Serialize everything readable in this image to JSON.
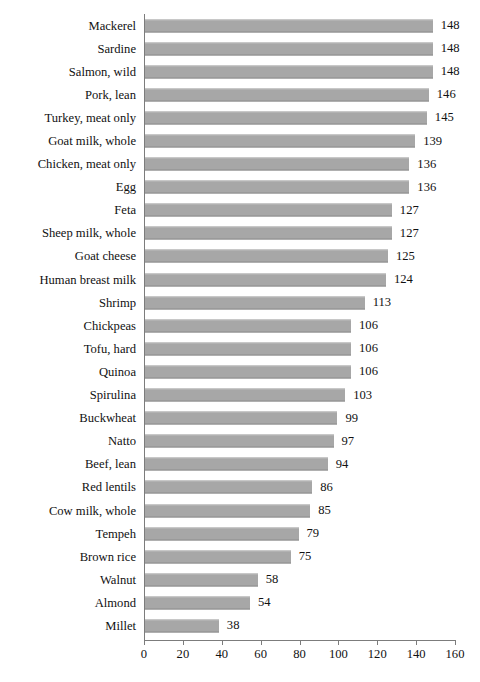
{
  "chart_data": {
    "type": "bar",
    "orientation": "horizontal",
    "title": "",
    "xlabel": "",
    "ylabel": "",
    "xlim": [
      0,
      160
    ],
    "xticks": [
      0,
      20,
      40,
      60,
      80,
      100,
      120,
      140,
      160
    ],
    "grid": false,
    "legend": null,
    "bar_color": "#a7a7a7",
    "axis_color": "#7c7c7c",
    "value_labels_shown": true,
    "categories": [
      "Mackerel",
      "Sardine",
      "Salmon, wild",
      "Pork, lean",
      "Turkey, meat only",
      "Goat milk, whole",
      "Chicken, meat only",
      "Egg",
      "Feta",
      "Sheep milk, whole",
      "Goat cheese",
      "Human breast milk",
      "Shrimp",
      "Chickpeas",
      "Tofu, hard",
      "Quinoa",
      "Spirulina",
      "Buckwheat",
      "Natto",
      "Beef, lean",
      "Red lentils",
      "Cow milk, whole",
      "Tempeh",
      "Brown rice",
      "Walnut",
      "Almond",
      "Millet"
    ],
    "values": [
      148,
      148,
      148,
      146,
      145,
      139,
      136,
      136,
      127,
      127,
      125,
      124,
      113,
      106,
      106,
      106,
      103,
      99,
      97,
      94,
      86,
      85,
      79,
      75,
      58,
      54,
      38
    ]
  }
}
